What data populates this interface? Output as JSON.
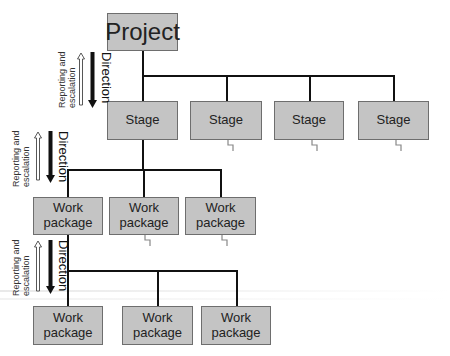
{
  "diagram": {
    "root": {
      "label": "Project"
    },
    "stages": [
      {
        "label": "Stage"
      },
      {
        "label": "Stage"
      },
      {
        "label": "Stage"
      },
      {
        "label": "Stage"
      }
    ],
    "work_packages_level1": [
      {
        "line1": "Work",
        "line2": "package"
      },
      {
        "line1": "Work",
        "line2": "package"
      },
      {
        "line1": "Work",
        "line2": "package"
      }
    ],
    "work_packages_level2": [
      {
        "line1": "Work",
        "line2": "package"
      },
      {
        "line1": "Work",
        "line2": "package"
      },
      {
        "line1": "Work",
        "line2": "package"
      }
    ],
    "side_labels": [
      {
        "up_line1": "Reporting and",
        "up_line2": "escalation",
        "down": "Direction"
      },
      {
        "up_line1": "Reporting and",
        "up_line2": "escalation",
        "down": "Direction"
      },
      {
        "up_line1": "Reporting and",
        "up_line2": "escalation",
        "down": "Direction"
      }
    ],
    "colors": {
      "box_fill": "#c4c4c4",
      "box_border": "#6e6e6e",
      "line": "#111111"
    }
  }
}
